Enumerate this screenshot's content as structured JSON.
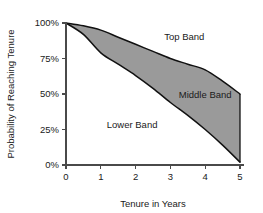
{
  "chart_data": {
    "type": "area",
    "title": "",
    "xlabel": "Tenure in Years",
    "ylabel": "Probability of Reaching Tenure",
    "xlim": [
      0,
      5
    ],
    "ylim": [
      0,
      100
    ],
    "grid": false,
    "legend_position": "inline-annotations",
    "x_ticks": [
      "0",
      "1",
      "2",
      "3",
      "4",
      "5"
    ],
    "x_tick_values": [
      0,
      1,
      2,
      3,
      4,
      5
    ],
    "y_ticks": [
      "0%",
      "25%",
      "50%",
      "75%",
      "100%"
    ],
    "y_tick_values": [
      0,
      25,
      50,
      75,
      100
    ],
    "x": [
      0,
      0.5,
      1,
      1.5,
      2,
      2.5,
      3,
      3.5,
      4,
      4.5,
      5
    ],
    "series": [
      {
        "name": "Upper bound curve",
        "values": [
          100,
          98,
          95,
          90,
          85,
          80,
          75,
          71,
          67,
          59,
          50
        ]
      },
      {
        "name": "Lower bound curve",
        "values": [
          100,
          92,
          79,
          71,
          63,
          54,
          44,
          35,
          25,
          14,
          2
        ]
      }
    ],
    "shaded_region": {
      "name": "Middle Band",
      "between": [
        "Lower bound curve",
        "Upper bound curve"
      ],
      "fill_color": "#9a9a9a"
    },
    "annotations": [
      {
        "label": "Top Band",
        "x": 3.4,
        "y": 88
      },
      {
        "label": "Middle Band",
        "x": 4.0,
        "y": 47
      },
      {
        "label": "Lower Band",
        "x": 1.9,
        "y": 26
      }
    ],
    "colors": {
      "band_fill": "#9a9a9a",
      "curve_stroke": "#111111",
      "axis": "#4a4a4a",
      "text": "#1a1a1a",
      "background": "#ffffff"
    }
  }
}
